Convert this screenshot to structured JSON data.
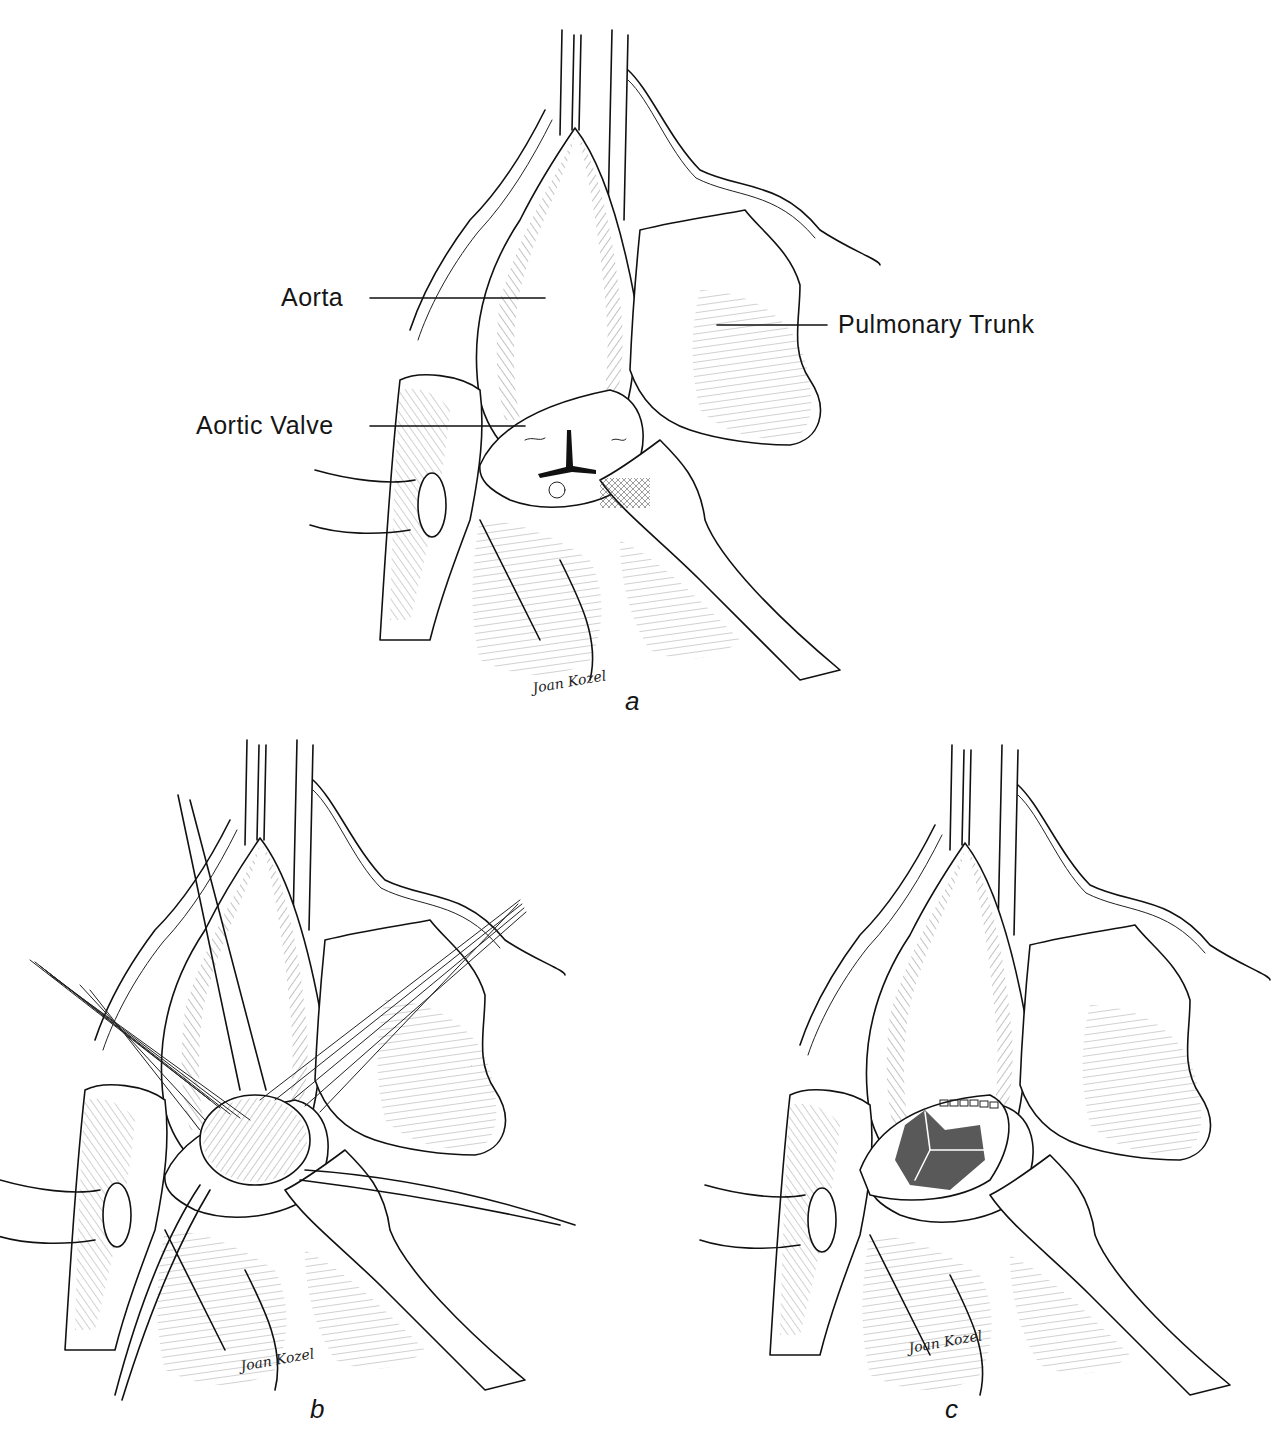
{
  "figure": {
    "panels": [
      {
        "id": "a",
        "letter": "a",
        "signature": "Joan Kozel",
        "labels": {
          "aorta": "Aorta",
          "aortic_valve": "Aortic Valve",
          "pulmonary_trunk": "Pulmonary Trunk"
        }
      },
      {
        "id": "b",
        "letter": "b",
        "signature": "Joan Kozel"
      },
      {
        "id": "c",
        "letter": "c",
        "signature": "Joan Kozel"
      }
    ],
    "colors": {
      "ink": "#111111",
      "paper": "#ffffff"
    }
  }
}
